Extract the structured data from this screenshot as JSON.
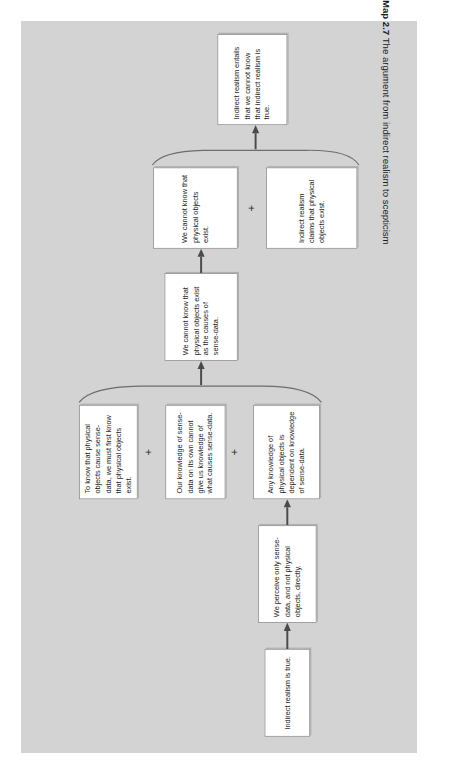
{
  "figure": {
    "caption_label": "Map 2.7",
    "caption_text": "The argument from indirect realism to scepticism",
    "panel_color": "#d3d3d3",
    "box_fill": "#ffffff",
    "box_border": "#8e8e8e",
    "text_color": "#1c1c1c"
  },
  "diagram": {
    "type": "argument-map",
    "orientation": "rotated-90-ccw",
    "connector_symbol": "+",
    "nodes": [
      {
        "id": "n1",
        "label": "Indirect realism is true."
      },
      {
        "id": "n2",
        "label": "We perceive only sense-data, and not physical objects, directly."
      },
      {
        "id": "n3",
        "label": "Any knowledge of physical objects is dependent on knowledge of sense-data."
      },
      {
        "id": "n4",
        "label": "Our knowledge of sense-data on its own cannot give us knowledge of what causes sense-data."
      },
      {
        "id": "n5",
        "label": "To know that physical objects cause sense-data, we must first know that physical objects exist."
      },
      {
        "id": "n6",
        "label": "We cannot know that physical objects exist as the causes of sense-data."
      },
      {
        "id": "n7",
        "label": "We cannot know that physical objects exist."
      },
      {
        "id": "n8",
        "label": "Indirect realism claims that physical objects exist."
      },
      {
        "id": "n9",
        "label": "Indirect realism entails that we cannot know that indirect realism is true."
      }
    ],
    "conjunctions": [
      {
        "id": "c1",
        "symbol": "+",
        "joins": [
          "n3",
          "n4"
        ]
      },
      {
        "id": "c2",
        "symbol": "+",
        "joins": [
          "n4",
          "n5"
        ]
      },
      {
        "id": "c3",
        "symbol": "+",
        "joins": [
          "n7",
          "n8"
        ]
      }
    ],
    "edges": [
      {
        "from": "n1",
        "to": "n2"
      },
      {
        "from": "n2",
        "to": "n3"
      },
      {
        "from": "n3+n4+n5",
        "to": "n6"
      },
      {
        "from": "n6",
        "to": "n7"
      },
      {
        "from": "n7+n8",
        "to": "n9"
      }
    ]
  }
}
